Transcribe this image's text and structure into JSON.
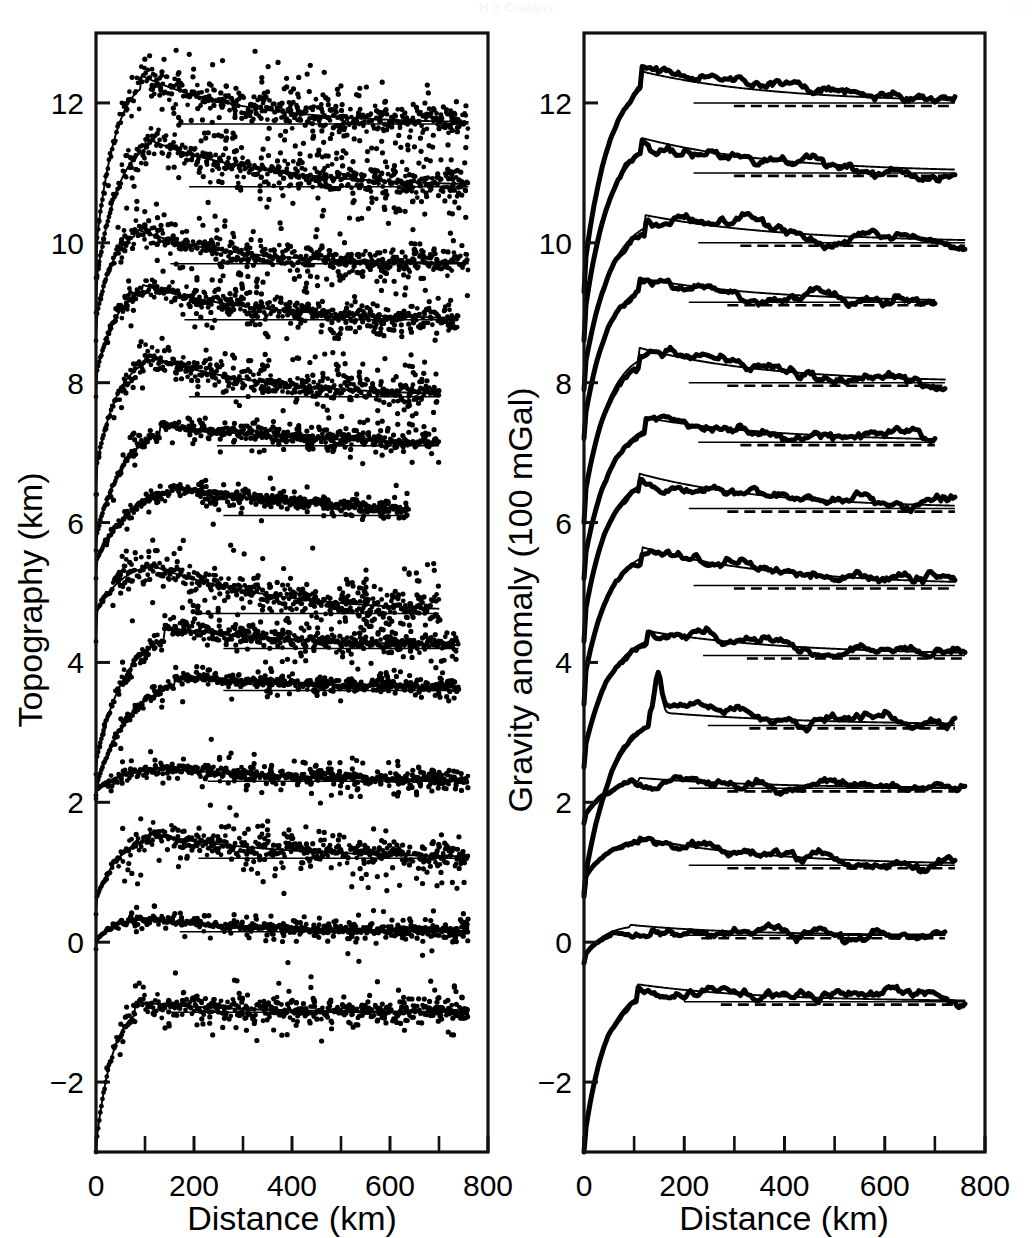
{
  "header": {
    "running_head": "H.2 Cratons",
    "page_number": "103"
  },
  "panels": [
    {
      "id": "topography",
      "ylabel": "Topography (km)",
      "xlabel": "Distance (km)",
      "ytick_labels": [
        "-2",
        "0",
        "2",
        "4",
        "6",
        "8",
        "10",
        "12"
      ],
      "xtick_labels": [
        "0",
        "200",
        "400",
        "600",
        "800"
      ],
      "render": "scatter-plus-fit"
    },
    {
      "id": "gravity",
      "ylabel": "Gravity anomaly (100 mGal)",
      "xlabel": "Distance (km)",
      "ytick_labels": [
        "-2",
        "0",
        "2",
        "4",
        "6",
        "8",
        "10",
        "12"
      ],
      "xtick_labels": [
        "0",
        "200",
        "400",
        "600",
        "800"
      ],
      "render": "thick-line-plus-fit"
    }
  ],
  "chart_data": [
    {
      "type": "scatter",
      "panel": "topography",
      "title": "Topography (km)",
      "xlabel": "Distance (km)",
      "ylabel": "Topography (km)",
      "xlim": [
        0,
        800
      ],
      "ylim": [
        -3.0,
        13.0
      ],
      "xticks": [
        0,
        200,
        400,
        600,
        800
      ],
      "xticks_minor": [
        100,
        300,
        500,
        700
      ],
      "yticks": [
        -2,
        0,
        2,
        4,
        6,
        8,
        10,
        12
      ],
      "grid": false,
      "legend": "none",
      "notes": "Thirteen stacked cross-sectional profiles, each offset vertically by about 1 unit. Each profile shows scattered observations (dots) with an overlying smooth model curve and a horizontal asymptote/reference line at the profile plateau level.",
      "series": [
        {
          "name": "profile-1",
          "offset": 11.7,
          "start": 9.5,
          "peak_value": 12.4,
          "peak_x": 90,
          "plateau": 11.7,
          "x_end": 760,
          "scatter_sigma": 0.3,
          "n_points": 210
        },
        {
          "name": "profile-2",
          "offset": 10.8,
          "start": 9.0,
          "peak_value": 11.5,
          "peak_x": 100,
          "plateau": 10.8,
          "x_end": 760,
          "scatter_sigma": 0.3,
          "n_points": 210
        },
        {
          "name": "profile-3",
          "offset": 9.7,
          "start": 8.6,
          "peak_value": 10.2,
          "peak_x": 80,
          "plateau": 9.7,
          "x_end": 760,
          "scatter_sigma": 0.22,
          "n_points": 200
        },
        {
          "name": "profile-4",
          "offset": 8.9,
          "start": 7.8,
          "peak_value": 9.4,
          "peak_x": 95,
          "plateau": 8.9,
          "x_end": 740,
          "scatter_sigma": 0.2,
          "n_points": 200
        },
        {
          "name": "profile-5",
          "offset": 7.8,
          "start": 6.4,
          "peak_value": 8.4,
          "peak_x": 100,
          "plateau": 7.8,
          "x_end": 700,
          "scatter_sigma": 0.22,
          "n_points": 190
        },
        {
          "name": "profile-6",
          "offset": 7.1,
          "start": 5.6,
          "peak_value": 7.4,
          "peak_x": 130,
          "plateau": 7.1,
          "x_end": 700,
          "scatter_sigma": 0.12,
          "n_points": 180
        },
        {
          "name": "profile-7",
          "offset": 6.1,
          "start": 5.2,
          "peak_value": 6.5,
          "peak_x": 150,
          "plateau": 6.1,
          "x_end": 640,
          "scatter_sigma": 0.1,
          "n_points": 170
        },
        {
          "name": "profile-8",
          "offset": 4.7,
          "start": 4.3,
          "peak_value": 5.4,
          "peak_x": 110,
          "plateau": 4.7,
          "x_end": 700,
          "scatter_sigma": 0.26,
          "n_points": 200
        },
        {
          "name": "profile-9",
          "offset": 4.2,
          "start": 2.4,
          "peak_value": 4.5,
          "peak_x": 140,
          "plateau": 4.2,
          "x_end": 740,
          "scatter_sigma": 0.16,
          "n_points": 190
        },
        {
          "name": "profile-10",
          "offset": 3.6,
          "start": 2.1,
          "peak_value": 3.8,
          "peak_x": 160,
          "plateau": 3.6,
          "x_end": 740,
          "scatter_sigma": 0.1,
          "n_points": 180
        },
        {
          "name": "profile-11",
          "offset": 2.3,
          "start": 2.05,
          "peak_value": 2.5,
          "peak_x": 120,
          "plateau": 2.3,
          "x_end": 760,
          "scatter_sigma": 0.12,
          "n_points": 200
        },
        {
          "name": "profile-12",
          "offset": 1.2,
          "start": 0.4,
          "peak_value": 1.55,
          "peak_x": 110,
          "plateau": 1.2,
          "x_end": 760,
          "scatter_sigma": 0.22,
          "n_points": 200
        },
        {
          "name": "profile-13",
          "offset": 0.15,
          "start": -0.1,
          "peak_value": 0.35,
          "peak_x": 90,
          "plateau": 0.15,
          "x_end": 760,
          "scatter_sigma": 0.1,
          "n_points": 180
        },
        {
          "name": "profile-14",
          "offset": -1.0,
          "start": -3.0,
          "peak_value": -0.85,
          "peak_x": 80,
          "plateau": -1.0,
          "x_end": 760,
          "scatter_sigma": 0.18,
          "n_points": 200
        }
      ]
    },
    {
      "type": "line",
      "panel": "gravity",
      "title": "Gravity anomaly (100 mGal)",
      "xlabel": "Distance (km)",
      "ylabel": "Gravity anomaly (100 mGal)",
      "xlim": [
        0,
        800
      ],
      "ylim": [
        -3.0,
        13.0
      ],
      "xticks": [
        0,
        200,
        400,
        600,
        800
      ],
      "xticks_minor": [
        100,
        300,
        500,
        700
      ],
      "yticks": [
        -2,
        0,
        2,
        4,
        6,
        8,
        10,
        12
      ],
      "grid": false,
      "legend": "none",
      "notes": "Thirteen stacked gravity anomaly profiles. Each rises steeply from a low value at the origin, overshoots to a peak near 100-150 km, then decays to a near-constant plateau. A thin solid model curve and a dashed reference line accompany each thick observed profile.",
      "series": [
        {
          "name": "profile-1",
          "offset": 12.0,
          "start": 9.3,
          "peak_value": 12.45,
          "peak_x": 115,
          "plateau": 12.0,
          "x_end": 740,
          "spike": null
        },
        {
          "name": "profile-2",
          "offset": 11.0,
          "start": 8.6,
          "peak_value": 11.5,
          "peak_x": 115,
          "plateau": 11.0,
          "x_end": 740,
          "spike": null
        },
        {
          "name": "profile-3",
          "offset": 10.0,
          "start": 7.9,
          "peak_value": 10.4,
          "peak_x": 120,
          "plateau": 10.0,
          "x_end": 760,
          "spike": null
        },
        {
          "name": "profile-4",
          "offset": 9.15,
          "start": 7.2,
          "peak_value": 9.5,
          "peak_x": 110,
          "plateau": 9.15,
          "x_end": 700,
          "spike": null
        },
        {
          "name": "profile-5",
          "offset": 8.0,
          "start": 6.0,
          "peak_value": 8.5,
          "peak_x": 110,
          "plateau": 8.0,
          "x_end": 720,
          "spike": null
        },
        {
          "name": "profile-6",
          "offset": 7.15,
          "start": 5.2,
          "peak_value": 7.5,
          "peak_x": 120,
          "plateau": 7.15,
          "x_end": 700,
          "spike": null
        },
        {
          "name": "profile-7",
          "offset": 6.2,
          "start": 4.3,
          "peak_value": 6.7,
          "peak_x": 110,
          "plateau": 6.2,
          "x_end": 740,
          "spike": null
        },
        {
          "name": "profile-8",
          "offset": 5.1,
          "start": 3.4,
          "peak_value": 5.65,
          "peak_x": 115,
          "plateau": 5.1,
          "x_end": 740,
          "spike": null
        },
        {
          "name": "profile-9",
          "offset": 4.1,
          "start": 2.5,
          "peak_value": 4.45,
          "peak_x": 125,
          "plateau": 4.1,
          "x_end": 760,
          "spike": null
        },
        {
          "name": "profile-10",
          "offset": 3.1,
          "start": 0.7,
          "peak_value": 3.3,
          "peak_x": 130,
          "plateau": 3.1,
          "x_end": 740,
          "spike": {
            "x": 148,
            "value": 3.85
          }
        },
        {
          "name": "profile-11",
          "offset": 2.2,
          "start": 1.7,
          "peak_value": 2.35,
          "peak_x": 110,
          "plateau": 2.2,
          "x_end": 760,
          "spike": null
        },
        {
          "name": "profile-12",
          "offset": 1.1,
          "start": 0.65,
          "peak_value": 1.5,
          "peak_x": 110,
          "plateau": 1.1,
          "x_end": 740,
          "spike": null
        },
        {
          "name": "profile-13",
          "offset": 0.1,
          "start": -0.3,
          "peak_value": 0.25,
          "peak_x": 90,
          "plateau": 0.1,
          "x_end": 720,
          "spike": null
        },
        {
          "name": "profile-14",
          "offset": -0.85,
          "start": -3.0,
          "peak_value": -0.6,
          "peak_x": 105,
          "plateau": -0.85,
          "x_end": 760,
          "spike": null
        }
      ]
    }
  ],
  "colors": {
    "ink": "#000000",
    "background": "#ffffff"
  }
}
